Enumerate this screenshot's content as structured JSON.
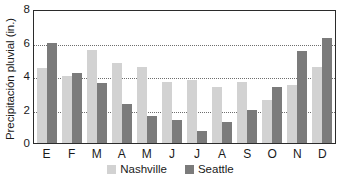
{
  "chart_data": {
    "type": "bar",
    "title": "",
    "subtitle": "",
    "xlabel": "",
    "ylabel": "Precipitación pluvial (in.)",
    "categories": [
      "E",
      "F",
      "M",
      "A",
      "M",
      "J",
      "J",
      "A",
      "S",
      "O",
      "N",
      "D"
    ],
    "series": [
      {
        "name": "Nashville",
        "color": "#d2d2d2",
        "values": [
          4.5,
          4.0,
          5.55,
          4.75,
          4.55,
          3.65,
          3.75,
          3.35,
          3.65,
          2.55,
          3.45,
          4.55
        ]
      },
      {
        "name": "Seattle",
        "color": "#7b7b7b",
        "values": [
          6.0,
          4.2,
          3.6,
          2.35,
          1.6,
          1.4,
          0.7,
          1.25,
          1.95,
          3.35,
          5.5,
          6.25
        ]
      }
    ],
    "ylim": [
      0,
      8
    ],
    "yticks": [
      0,
      2,
      4,
      6,
      8
    ],
    "ytick_labels": [
      "0",
      "2",
      "4",
      "6",
      "8"
    ],
    "gridlines": [
      2,
      4,
      6
    ],
    "grid": true,
    "grid_style": "dotted",
    "legend_position": "bottom-center",
    "frame": true
  },
  "legend": {
    "entries": [
      {
        "label": "Nashville",
        "swatch": "nashville-swatch"
      },
      {
        "label": "Seattle",
        "swatch": "seattle-swatch"
      }
    ]
  },
  "colors": {
    "nashville": "#d2d2d2",
    "seattle": "#7b7b7b",
    "axis": "#2b2b2b",
    "grid": "#6e6e6e",
    "text": "#1a1a1a",
    "background": "#ffffff"
  }
}
